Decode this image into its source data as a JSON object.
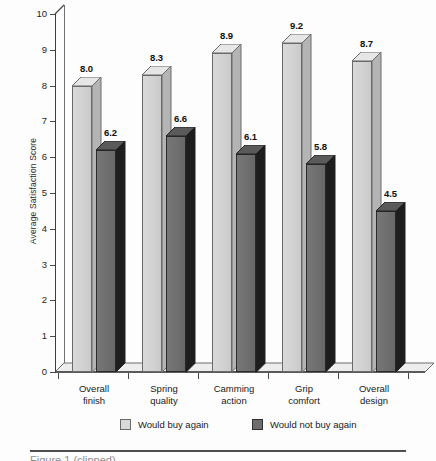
{
  "chart_data": {
    "type": "bar",
    "title": "",
    "xlabel": "",
    "ylabel": "Average Satisfaction Score",
    "ylim": [
      0,
      10
    ],
    "ytick_labels": [
      "0",
      "1",
      "2",
      "3",
      "4",
      "5",
      "6",
      "7",
      "8",
      "9",
      "10"
    ],
    "grid": false,
    "legend_position": "bottom",
    "style": "3d-grouped-bars",
    "categories": [
      "Overall finish",
      "Spring quality",
      "Camming action",
      "Grip comfort",
      "Overall design"
    ],
    "category_lines": [
      [
        "Overall",
        "finish"
      ],
      [
        "Spring",
        "quality"
      ],
      [
        "Camming",
        "action"
      ],
      [
        "Grip",
        "comfort"
      ],
      [
        "Overall",
        "design"
      ]
    ],
    "series": [
      {
        "name": "Would buy again",
        "color": "#d9d9d9",
        "values": [
          8.0,
          8.3,
          8.9,
          9.2,
          8.7
        ],
        "value_labels": [
          "8.0",
          "8.3",
          "8.9",
          "9.2",
          "8.7"
        ]
      },
      {
        "name": "Would not buy again",
        "color": "#6d6d6d",
        "values": [
          6.2,
          6.6,
          6.1,
          5.8,
          4.5
        ],
        "value_labels": [
          "6.2",
          "6.6",
          "6.1",
          "5.8",
          "4.5"
        ]
      }
    ]
  },
  "legend": {
    "items": [
      {
        "label": "Would buy again",
        "swatch": "light"
      },
      {
        "label": "Would not buy again",
        "swatch": "dark"
      }
    ]
  },
  "caption": {
    "text": "Figure 1 (clipped)"
  }
}
